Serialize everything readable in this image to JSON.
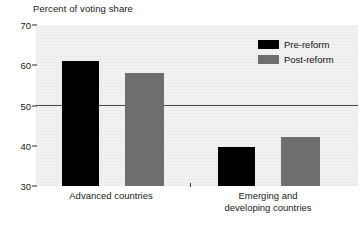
{
  "chart_data": {
    "type": "bar",
    "title": "Percent of voting share",
    "xlabel": "",
    "ylabel": "",
    "ylim": [
      30,
      70
    ],
    "yticks": [
      30,
      40,
      50,
      60,
      70
    ],
    "ytick_labels": [
      "30",
      "40",
      "50",
      "60",
      "70"
    ],
    "grid": false,
    "legend_position": "top-right",
    "categories": [
      "Advanced countries",
      "Emerging and developing countries"
    ],
    "category_lines": [
      [
        "Advanced countries"
      ],
      [
        "Emerging and",
        "developing countries"
      ]
    ],
    "series": [
      {
        "name": "Pre-reform",
        "color": "#000000",
        "values": [
          61.0,
          39.7
        ]
      },
      {
        "name": "Post-reform",
        "color": "#6e6e6e",
        "values": [
          58.0,
          42.2
        ]
      }
    ],
    "reference_line": {
      "value": 50,
      "color": "#4a4a4a"
    },
    "plot_background": "#f2f2f2"
  },
  "legend": {
    "items": [
      {
        "label": "Pre-reform"
      },
      {
        "label": "Post-reform"
      }
    ]
  }
}
